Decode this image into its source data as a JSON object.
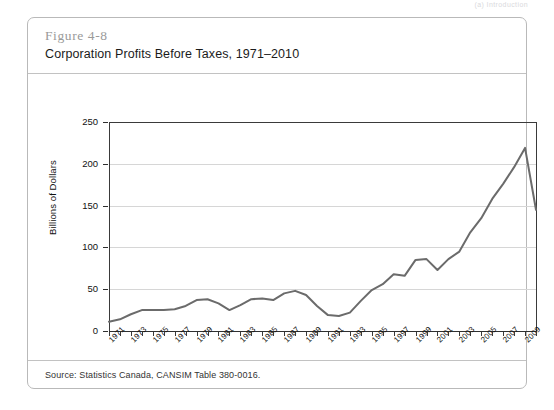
{
  "running_head": "(a)  Introduction",
  "figure": {
    "number": "Figure 4-8",
    "title": "Corporation Profits Before Taxes, 1971–2010",
    "source": "Source: Statistics Canada, CANSIM Table 380-0016."
  },
  "colors": {
    "series_line": "#6b6b6b",
    "grid": "#d6d6d6",
    "axis": "#3a3a3a",
    "box_border": "#b9b9b9",
    "figure_number": "#9a9a9a",
    "text": "#1b1b1b"
  },
  "chart_data": {
    "type": "line",
    "title": "Corporation Profits Before Taxes, 1971–2010",
    "xlabel": "",
    "ylabel": "Billions of Dollars",
    "ylim": [
      0,
      250
    ],
    "yticks": [
      0,
      50,
      100,
      150,
      200,
      250
    ],
    "ytick_labels": [
      "0",
      "50",
      "100",
      "150",
      "200",
      "250"
    ],
    "xlim": [
      1971,
      2010
    ],
    "xtick_labels": [
      "1971",
      "1973",
      "1975",
      "1977",
      "1979",
      "1981",
      "1983",
      "1985",
      "1987",
      "1989",
      "1991",
      "1993",
      "1995",
      "1997",
      "1999",
      "2001",
      "2003",
      "2005",
      "2007",
      "2009"
    ],
    "grid": true,
    "legend": false,
    "x": [
      1971,
      1972,
      1973,
      1974,
      1975,
      1976,
      1977,
      1978,
      1979,
      1980,
      1981,
      1982,
      1983,
      1984,
      1985,
      1986,
      1987,
      1988,
      1989,
      1990,
      1991,
      1992,
      1993,
      1994,
      1995,
      1996,
      1997,
      1998,
      1999,
      2000,
      2001,
      2002,
      2003,
      2004,
      2005,
      2006,
      2007,
      2008,
      2009,
      2010
    ],
    "series": [
      {
        "name": "Corporation Profits Before Taxes",
        "values": [
          11,
          14,
          20,
          25,
          25,
          25,
          26,
          30,
          37,
          38,
          33,
          25,
          31,
          38,
          39,
          37,
          45,
          48,
          43,
          30,
          19,
          18,
          22,
          36,
          49,
          56,
          68,
          66,
          85,
          86,
          73,
          86,
          95,
          118,
          135,
          158,
          176,
          196,
          219,
          145
        ]
      }
    ],
    "annotations": []
  }
}
